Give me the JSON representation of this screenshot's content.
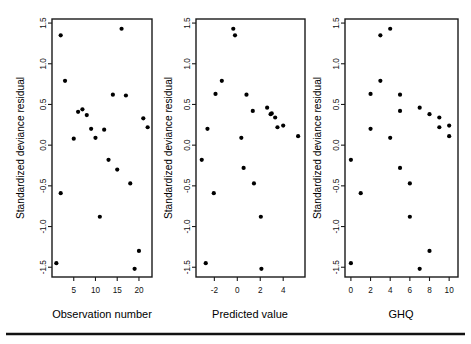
{
  "figure": {
    "background_color": "#ffffff",
    "ink_color": "#000000",
    "panel_count": 3,
    "footer_rule": {
      "visible": true,
      "y": 334,
      "x_start": 6,
      "x_end": 465
    }
  },
  "chart_data": [
    {
      "type": "scatter",
      "title": "",
      "xlabel": "Observation number",
      "ylabel": "Standardized deviance residual",
      "xlim": [
        0,
        23
      ],
      "ylim": [
        -1.62,
        1.55
      ],
      "xticks": [
        5,
        10,
        15,
        20
      ],
      "xtick_labels": [
        "5",
        "10",
        "15",
        "20"
      ],
      "yticks": [
        -1.5,
        -1.0,
        -0.5,
        0.0,
        0.5,
        1.0,
        1.5
      ],
      "ytick_labels": [
        "-1.5",
        "-1.0",
        "-0.5",
        "0.0",
        "0.5",
        "1.0",
        "1.5"
      ],
      "grid": false,
      "legend": "none",
      "x": [
        1,
        2,
        2,
        3,
        5,
        6,
        7,
        8,
        9,
        10,
        11,
        12,
        13,
        14,
        15,
        16,
        17,
        18,
        19,
        20,
        21,
        22
      ],
      "y": [
        -1.45,
        -0.59,
        1.35,
        0.79,
        0.08,
        0.41,
        0.44,
        0.37,
        0.2,
        0.09,
        -0.88,
        0.19,
        -0.18,
        0.62,
        -0.3,
        1.43,
        0.61,
        -0.47,
        -1.52,
        -1.3,
        0.33,
        0.22
      ]
    },
    {
      "type": "scatter",
      "title": "",
      "xlabel": "Predicted value",
      "ylabel": "Standardized deviance residual",
      "xlim": [
        -3.6,
        5.9
      ],
      "ylim": [
        -1.62,
        1.55
      ],
      "xticks": [
        -2,
        0,
        2,
        4
      ],
      "xtick_labels": [
        "-2",
        "0",
        "2",
        "4"
      ],
      "yticks": [
        -1.5,
        -1.0,
        -0.5,
        0.0,
        0.5,
        1.0,
        1.5
      ],
      "ytick_labels": [
        "-1.5",
        "-1.0",
        "-0.5",
        "0.0",
        "0.5",
        "1.0",
        "1.5"
      ],
      "grid": false,
      "legend": "none",
      "x": [
        -3.1,
        -2.75,
        -2.6,
        -2.05,
        -1.9,
        -1.35,
        -0.35,
        -0.2,
        0.35,
        0.55,
        0.8,
        1.35,
        1.45,
        2.05,
        2.1,
        2.6,
        2.9,
        3.0,
        3.3,
        3.5,
        4.0,
        5.3
      ],
      "y": [
        -0.18,
        -1.45,
        0.2,
        -0.59,
        0.63,
        0.79,
        1.43,
        1.35,
        0.09,
        -0.28,
        0.62,
        0.42,
        -0.47,
        -0.88,
        -1.52,
        0.46,
        0.38,
        0.39,
        0.34,
        0.22,
        0.24,
        0.11
      ]
    },
    {
      "type": "scatter",
      "title": "",
      "xlabel": "GHQ",
      "ylabel": "Standardized deviance residual",
      "xlim": [
        -0.6,
        10.9
      ],
      "ylim": [
        -1.62,
        1.55
      ],
      "xticks": [
        0,
        2,
        4,
        6,
        8,
        10
      ],
      "xtick_labels": [
        "0",
        "2",
        "4",
        "6",
        "8",
        "10"
      ],
      "yticks": [
        -1.5,
        -1.0,
        -0.5,
        0.0,
        0.5,
        1.0,
        1.5
      ],
      "ytick_labels": [
        "-1.5",
        "-1.0",
        "-0.5",
        "0.0",
        "0.5",
        "1.0",
        "1.5"
      ],
      "grid": false,
      "legend": "none",
      "x": [
        0,
        0,
        1,
        2,
        2,
        3,
        3,
        4,
        4,
        5,
        5,
        5,
        6,
        6,
        7,
        7,
        8,
        8,
        9,
        9,
        10,
        10
      ],
      "y": [
        -0.18,
        -1.45,
        -0.59,
        0.2,
        0.63,
        0.79,
        1.35,
        1.43,
        0.09,
        -0.28,
        0.62,
        0.42,
        -0.47,
        -0.88,
        -1.52,
        0.46,
        0.38,
        -1.3,
        0.34,
        0.22,
        0.24,
        0.11
      ]
    }
  ],
  "panels": [
    {
      "name": "observation-number-panel",
      "frame": {
        "x": 52,
        "y": 19,
        "width": 100,
        "height": 258
      },
      "xlabel": "Observation number",
      "ylabel": "Standardized deviance residual",
      "label_x_center": 102,
      "label_x_y": 318,
      "ylabel_x": 24,
      "ylabel_y": 148
    },
    {
      "name": "predicted-value-panel",
      "frame": {
        "x": 196,
        "y": 19,
        "width": 109,
        "height": 258
      },
      "xlabel": "Predicted value",
      "ylabel": "Standardized deviance residual",
      "label_x_center": 250,
      "label_x_y": 318,
      "ylabel_x": 172,
      "ylabel_y": 148
    },
    {
      "name": "ghq-panel",
      "frame": {
        "x": 345,
        "y": 19,
        "width": 113,
        "height": 258
      },
      "xlabel": "GHQ",
      "ylabel": "Standardized deviance residual",
      "label_x_center": 401,
      "label_x_y": 318,
      "ylabel_x": 321,
      "ylabel_y": 148
    }
  ]
}
